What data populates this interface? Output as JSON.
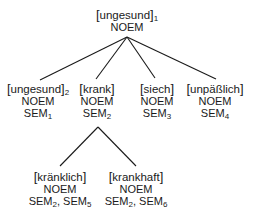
{
  "diagram": {
    "type": "tree",
    "root": {
      "word": "ungesund",
      "index": "1",
      "features": [
        "NOEM"
      ]
    },
    "level1": [
      {
        "word": "ungesund",
        "index": "2",
        "line1": "NOEM",
        "sem": "SEM",
        "sem_index": "1"
      },
      {
        "word": "krank",
        "index": "",
        "line1": "NOEM",
        "sem": "SEM",
        "sem_index": "2"
      },
      {
        "word": "siech",
        "index": "",
        "line1": "NOEM",
        "sem": "SEM",
        "sem_index": "3"
      },
      {
        "word": "unpäßlich",
        "index": "",
        "line1": "NOEM",
        "sem": "SEM",
        "sem_index": "4"
      }
    ],
    "level2": [
      {
        "parent": "krank",
        "word": "kränklich",
        "line1": "NOEM",
        "sem_a": "SEM",
        "sem_a_index": "2",
        "sem_b": "SEM",
        "sem_b_index": "5"
      },
      {
        "parent": "krank",
        "word": "krankhaft",
        "line1": "NOEM",
        "sem_a": "SEM",
        "sem_a_index": "2",
        "sem_b": "SEM",
        "sem_b_index": "6"
      }
    ],
    "brackets": {
      "open": "[",
      "close": "]"
    },
    "separator": ", "
  }
}
